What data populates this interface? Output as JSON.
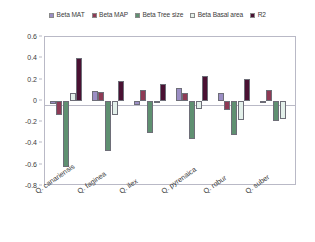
{
  "chart_data": {
    "type": "bar",
    "title": "",
    "subtitle": "",
    "xlabel": "",
    "ylabel": "",
    "ylim": [
      -0.8,
      0.6
    ],
    "ytick_labels": [
      "0.6",
      "0.4",
      "0.2",
      "0",
      "-0.2",
      "-0.4",
      "-0.6",
      "-0.8"
    ],
    "ytick_values": [
      0.6,
      0.4,
      0.2,
      0,
      -0.2,
      -0.4,
      -0.6,
      -0.8
    ],
    "grid": false,
    "legend_position": "top",
    "categories": [
      "Q. canariensis",
      "Q. faginea",
      "Q. ilex",
      "Q. pyrenaica",
      "Q. robur",
      "Q. suber"
    ],
    "series": [
      {
        "name": "Beta MAT",
        "color": "#9b8ec4",
        "values": [
          -0.03,
          0.09,
          -0.04,
          0.12,
          0.07,
          -0.02
        ]
      },
      {
        "name": "Beta MAP",
        "color": "#8e3a55",
        "values": [
          -0.13,
          0.08,
          0.1,
          0.07,
          -0.09,
          0.1
        ]
      },
      {
        "name": "Beta Tree size",
        "color": "#5f9071",
        "values": [
          -0.62,
          -0.47,
          -0.3,
          -0.36,
          -0.32,
          -0.19
        ]
      },
      {
        "name": "Beta Basal area",
        "color": "#e3f0ea",
        "values": [
          0.07,
          -0.13,
          -0.02,
          -0.08,
          -0.18,
          -0.17
        ]
      },
      {
        "name": "R2",
        "color": "#4a1133",
        "values": [
          0.4,
          0.19,
          0.16,
          0.23,
          0.21,
          null
        ]
      }
    ]
  },
  "legend": {
    "items": [
      {
        "label": "Beta MAT",
        "color": "#9b8ec4"
      },
      {
        "label": "Beta MAP",
        "color": "#8e3a55"
      },
      {
        "label": "Beta Tree size",
        "color": "#5f9071"
      },
      {
        "label": "Beta Basal area",
        "color": "#e3f0ea"
      },
      {
        "label": "R2",
        "color": "#4a1133"
      }
    ]
  }
}
